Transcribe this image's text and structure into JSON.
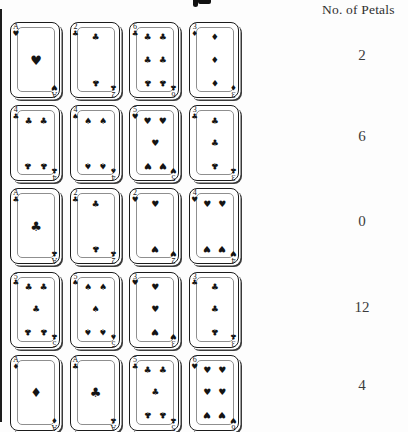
{
  "header": {
    "petals_label": "No. of Petals"
  },
  "rows": [
    {
      "petals": "2",
      "cards": [
        {
          "rank": "A",
          "suit": "heart"
        },
        {
          "rank": "2",
          "suit": "club"
        },
        {
          "rank": "6",
          "suit": "club"
        },
        {
          "rank": "3",
          "suit": "diamond"
        }
      ]
    },
    {
      "petals": "6",
      "cards": [
        {
          "rank": "4",
          "suit": "club"
        },
        {
          "rank": "4",
          "suit": "spade"
        },
        {
          "rank": "5",
          "suit": "heart"
        },
        {
          "rank": "3",
          "suit": "club"
        }
      ]
    },
    {
      "petals": "0",
      "cards": [
        {
          "rank": "A",
          "suit": "club"
        },
        {
          "rank": "2",
          "suit": "club"
        },
        {
          "rank": "2",
          "suit": "heart"
        },
        {
          "rank": "4",
          "suit": "heart"
        }
      ]
    },
    {
      "petals": "12",
      "cards": [
        {
          "rank": "5",
          "suit": "club"
        },
        {
          "rank": "5",
          "suit": "spade"
        },
        {
          "rank": "3",
          "suit": "heart"
        },
        {
          "rank": "3",
          "suit": "club"
        }
      ]
    },
    {
      "petals": "4",
      "cards": [
        {
          "rank": "A",
          "suit": "diamond"
        },
        {
          "rank": "A",
          "suit": "club"
        },
        {
          "rank": "5",
          "suit": "club"
        },
        {
          "rank": "6",
          "suit": "heart"
        }
      ]
    }
  ],
  "suit_glyphs": {
    "heart": "♥",
    "diamond": "♦",
    "club": "♣",
    "spade": "♠"
  },
  "colors": {
    "ink": "#141414",
    "card_border": "#1b1b1b",
    "shadow": "#3a3a3a",
    "text": "#3b3b3b"
  }
}
